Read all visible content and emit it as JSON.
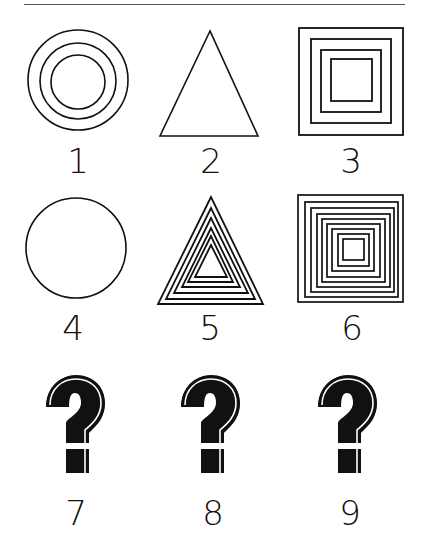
{
  "header": {
    "rule": true
  },
  "puzzle": {
    "cells": [
      {
        "index": 1,
        "label": "1",
        "shape": "concentric-circles",
        "count": 3
      },
      {
        "index": 2,
        "label": "2",
        "shape": "triangle",
        "count": 1
      },
      {
        "index": 3,
        "label": "3",
        "shape": "nested-squares",
        "count": 4
      },
      {
        "index": 4,
        "label": "4",
        "shape": "circle",
        "count": 1
      },
      {
        "index": 5,
        "label": "5",
        "shape": "nested-triangles",
        "count": 6
      },
      {
        "index": 6,
        "label": "6",
        "shape": "nested-squares",
        "count": 9
      },
      {
        "index": 7,
        "label": "7",
        "shape": "question-mark"
      },
      {
        "index": 8,
        "label": "8",
        "shape": "question-mark"
      },
      {
        "index": 9,
        "label": "9",
        "shape": "question-mark"
      }
    ]
  },
  "colors": {
    "stroke": "#111111",
    "background": "#ffffff"
  }
}
